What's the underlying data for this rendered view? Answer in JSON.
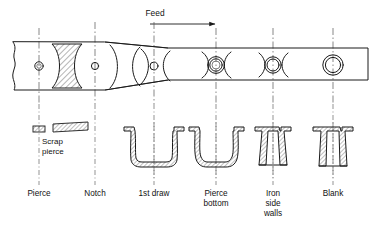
{
  "figure": {
    "feed": {
      "label": "Feed",
      "direction": "right",
      "arrow_icon": "arrow-right-icon"
    },
    "scrap": {
      "line1": "Scrap",
      "line2": "pierce"
    },
    "stations": [
      {
        "id": "pierce",
        "label": "Pierce",
        "label_lines": [
          "Pierce"
        ],
        "x": 39
      },
      {
        "id": "notch",
        "label": "Notch",
        "label_lines": [
          "Notch"
        ],
        "x": 95
      },
      {
        "id": "first-draw",
        "label": "1st draw",
        "label_lines": [
          "1st draw"
        ],
        "x": 154
      },
      {
        "id": "pierce-bottom",
        "label": "Pierce bottom",
        "label_lines": [
          "Pierce",
          "bottom"
        ],
        "x": 216
      },
      {
        "id": "iron-side-walls",
        "label": "Iron side walls",
        "label_lines": [
          "Iron",
          "side",
          "walls"
        ],
        "x": 273
      },
      {
        "id": "blank",
        "label": "Blank",
        "label_lines": [
          "Blank"
        ],
        "x": 333
      }
    ],
    "colors": {
      "ink": "#1a1a1a",
      "centerline": "#555555",
      "background": "#ffffff",
      "hatch": "#2a2a2a"
    }
  }
}
